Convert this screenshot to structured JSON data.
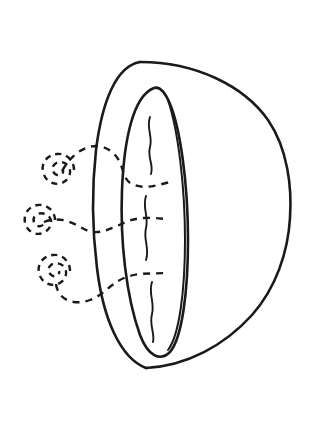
{
  "image": {
    "title": "Half sphere with inner ellipse and scent swirls",
    "kind": "line-drawing",
    "style": "coloring-book outline",
    "width": 318,
    "height": 434,
    "background_color": "#ffffff",
    "stroke_color": "#1a1a1a"
  },
  "shapes": {
    "outer_body": {
      "name": "half-sphere-body",
      "description": "Large D-shaped dome, flat-ish on left, bulging to the right",
      "path": "M 140 62 C 196 62 244 86 268 120 C 288 149 292 188 290 218 C 288 252 276 288 252 315 C 224 346 186 366 146 368",
      "stroke_width": 2.6
    },
    "outer_rim_left": {
      "name": "outer-rim-ellipse",
      "description": "Left outer ellipse edge of the opening rim",
      "path": "M 140 62 C 116 66 102 102 96 150 C 92 186 92 228 97 268 C 103 318 120 358 146 368",
      "stroke_width": 2.6
    },
    "inner_rim": {
      "name": "inner-rim-ellipse",
      "description": "Narrow inner ellipse forming the inner opening of the bowl",
      "path": "M 154 88 C 133 96 124 140 122 190 C 120 240 126 296 140 335 C 148 356 160 362 170 352 C 182 338 188 292 188 240 C 188 182 180 128 170 104 C 165 92 160 86 154 88 Z",
      "stroke_width": 2.6
    },
    "inner_rim_highlight": {
      "name": "inner-rim-inner-edge",
      "description": "Second thin contour just inside the inner ellipse on the right",
      "path": "M 168 100 C 178 130 185 186 185 240 C 185 292 179 336 168 350",
      "stroke_width": 2.0
    }
  },
  "wavy_lines": [
    {
      "name": "crack-line-top",
      "description": "Wavy vertical crack in upper part of inner ellipse",
      "path": "M 150 117 C 146 128 153 136 150 147 C 147 158 154 164 151 174"
    },
    {
      "name": "crack-line-middle",
      "description": "Wavy vertical crack in middle of inner ellipse",
      "path": "M 146 196 C 142 208 149 216 146 228 C 143 240 150 248 146 260"
    },
    {
      "name": "crack-line-bottom",
      "description": "Wavy vertical crack in lower part of inner ellipse",
      "path": "M 152 282 C 148 294 155 302 152 314 C 149 326 155 332 153 342"
    }
  ],
  "dashed_connectors": [
    {
      "name": "dashed-connector-top",
      "description": "Dashed curve from top swirl arcing right into the inner ellipse",
      "path": "M 62 171 C 76 146 98 140 112 152 C 126 164 120 178 132 184 C 144 190 158 185 170 182"
    },
    {
      "name": "dashed-connector-middle",
      "description": "Dashed curve from middle swirl running right into the inner ellipse",
      "path": "M 44 222 C 62 215 74 224 86 230 C 98 236 112 228 126 222 C 140 216 154 218 166 219"
    },
    {
      "name": "dashed-connector-bottom",
      "description": "Dashed curve from bottom swirl arcing right into the inner ellipse",
      "path": "M 56 284 C 58 300 74 306 90 300 C 104 295 110 284 124 278 C 138 272 152 274 166 273"
    }
  ],
  "spirals": [
    {
      "name": "scent-swirl-top",
      "description": "Dashed spiral swirl, upper left",
      "center_x": 63,
      "center_y": 171,
      "path": "M 74 170 C 74 160 66 153 57 154 C 47 155 41 163 43 172 C 45 181 54 186 62 183 C 69 180 72 173 69 167 C 66 162 59 160 55 164 C 51 167 52 173 57 175 C 61 176 64 173 63 170"
    },
    {
      "name": "scent-swirl-middle",
      "description": "Dashed spiral swirl, middle left",
      "center_x": 43,
      "center_y": 222,
      "path": "M 55 220 C 55 211 47 204 38 205 C 29 206 23 214 25 223 C 27 231 35 236 43 233 C 50 230 53 223 50 218 C 47 213 40 212 36 215 C 32 218 33 224 38 226 C 42 227 45 224 44 221"
    },
    {
      "name": "scent-swirl-bottom",
      "description": "Dashed spiral swirl, lower left",
      "center_x": 58,
      "center_y": 272,
      "path": "M 70 271 C 70 261 62 254 53 255 C 43 256 37 264 39 273 C 41 282 50 287 58 284 C 65 281 68 274 65 268 C 62 263 55 262 51 265 C 47 268 48 274 53 276 C 57 277 60 274 59 271"
    }
  ]
}
